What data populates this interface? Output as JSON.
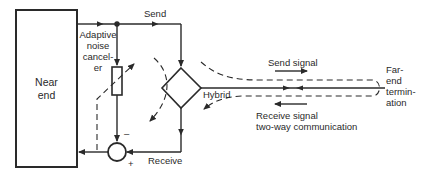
{
  "diagram": {
    "type": "echo-cancellation block diagram",
    "colors": {
      "stroke": "#2a2a2a",
      "background": "#ffffff"
    },
    "nodes": {
      "near_end": {
        "label_line1": "Near",
        "label_line2": "end"
      },
      "canceller": {
        "label_line1": "Adaptive",
        "label_line2": "noise",
        "label_line3": "cancel-",
        "label_line4": "er"
      },
      "hybrid": {
        "label": "Hybrid"
      },
      "summer": {
        "minus": "–",
        "plus": "+"
      },
      "far_end": {
        "label_line1": "Far-",
        "label_line2": "end",
        "label_line3": "termin-",
        "label_line4": "ation"
      }
    },
    "paths": {
      "send": {
        "label": "Send"
      },
      "receive": {
        "label": "Receive"
      }
    },
    "signals": {
      "send_signal": {
        "label": "Send signal"
      },
      "receive_signal": {
        "label_line1": "Receive signal",
        "label_line2": "two-way communication"
      }
    }
  }
}
